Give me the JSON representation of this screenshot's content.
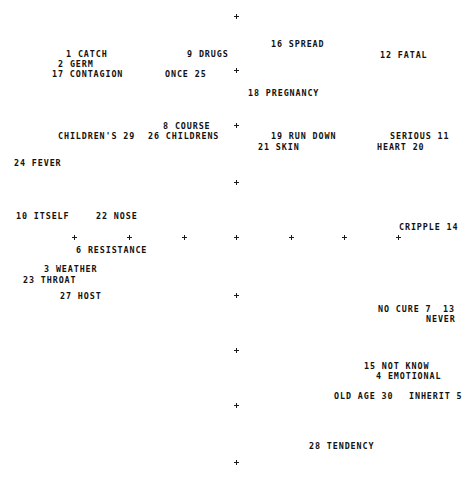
{
  "chart_data": {
    "type": "scatter",
    "title": "",
    "subtitle": "",
    "xlabel": "",
    "ylabel": "",
    "grid": false,
    "legend": null,
    "axis_style": "cross-tick markers only, no drawn axis lines",
    "xlim": [
      0,
      471
    ],
    "ylim": [
      0,
      477
    ],
    "note": "Point labels are rendered directly at the data coordinates; each label combines a rank number and a concept word.",
    "x_axis_ticks": [
      {
        "x": 75,
        "y": 237
      },
      {
        "x": 130,
        "y": 237
      },
      {
        "x": 185,
        "y": 237
      },
      {
        "x": 237,
        "y": 237
      },
      {
        "x": 292,
        "y": 237
      },
      {
        "x": 345,
        "y": 237
      },
      {
        "x": 399,
        "y": 237
      }
    ],
    "y_axis_ticks": [
      {
        "x": 237,
        "y": 16
      },
      {
        "x": 237,
        "y": 70
      },
      {
        "x": 237,
        "y": 125
      },
      {
        "x": 237,
        "y": 182
      },
      {
        "x": 237,
        "y": 237
      },
      {
        "x": 237,
        "y": 295
      },
      {
        "x": 237,
        "y": 350
      },
      {
        "x": 237,
        "y": 405
      },
      {
        "x": 237,
        "y": 462
      }
    ],
    "points": [
      {
        "id": 1,
        "label": "1 CATCH",
        "number": 1,
        "word": "CATCH",
        "x": 66,
        "y": 49
      },
      {
        "id": 2,
        "label": "9 DRUGS",
        "number": 9,
        "word": "DRUGS",
        "x": 187,
        "y": 49
      },
      {
        "id": 3,
        "label": "16 SPREAD",
        "number": 16,
        "word": "SPREAD",
        "x": 271,
        "y": 39
      },
      {
        "id": 4,
        "label": "12 FATAL",
        "number": 12,
        "word": "FATAL",
        "x": 380,
        "y": 50
      },
      {
        "id": 5,
        "label": "2 GERM",
        "number": 2,
        "word": "GERM",
        "x": 58,
        "y": 59
      },
      {
        "id": 6,
        "label": "17 CONTAGION",
        "number": 17,
        "word": "CONTAGION",
        "x": 52,
        "y": 69
      },
      {
        "id": 7,
        "label": "ONCE 25",
        "number": 25,
        "word": "ONCE",
        "x": 165,
        "y": 69
      },
      {
        "id": 8,
        "label": "18 PREGNANCY",
        "number": 18,
        "word": "PREGNANCY",
        "x": 248,
        "y": 88
      },
      {
        "id": 9,
        "label": "8 COURSE",
        "number": 8,
        "word": "COURSE",
        "x": 163,
        "y": 121
      },
      {
        "id": 10,
        "label": "CHILDREN'S 29",
        "number": 29,
        "word": "CHILDREN'S",
        "x": 58,
        "y": 131
      },
      {
        "id": 11,
        "label": "26 CHILDRENS",
        "number": 26,
        "word": "CHILDRENS",
        "x": 148,
        "y": 131
      },
      {
        "id": 12,
        "label": "19 RUN DOWN",
        "number": 19,
        "word": "RUN DOWN",
        "x": 271,
        "y": 131
      },
      {
        "id": 13,
        "label": "SERIOUS 11",
        "number": 11,
        "word": "SERIOUS",
        "x": 390,
        "y": 131
      },
      {
        "id": 14,
        "label": "21 SKIN",
        "number": 21,
        "word": "SKIN",
        "x": 258,
        "y": 142
      },
      {
        "id": 15,
        "label": "HEART 20",
        "number": 20,
        "word": "HEART",
        "x": 377,
        "y": 142
      },
      {
        "id": 16,
        "label": "24 FEVER",
        "number": 24,
        "word": "FEVER",
        "x": 14,
        "y": 158
      },
      {
        "id": 17,
        "label": "10 ITSELF",
        "number": 10,
        "word": "ITSELF",
        "x": 16,
        "y": 211
      },
      {
        "id": 18,
        "label": "22 NOSE",
        "number": 22,
        "word": "NOSE",
        "x": 96,
        "y": 211
      },
      {
        "id": 19,
        "label": "CRIPPLE 14",
        "number": 14,
        "word": "CRIPPLE",
        "x": 399,
        "y": 222
      },
      {
        "id": 20,
        "label": "6 RESISTANCE",
        "number": 6,
        "word": "RESISTANCE",
        "x": 76,
        "y": 245
      },
      {
        "id": 21,
        "label": "3 WEATHER",
        "number": 3,
        "word": "WEATHER",
        "x": 44,
        "y": 264
      },
      {
        "id": 22,
        "label": "23 THROAT",
        "number": 23,
        "word": "THROAT",
        "x": 23,
        "y": 275
      },
      {
        "id": 23,
        "label": "27 HOST",
        "number": 27,
        "word": "HOST",
        "x": 60,
        "y": 291
      },
      {
        "id": 24,
        "label": "NO CURE 7",
        "number": 7,
        "word": "NO CURE",
        "x": 378,
        "y": 304
      },
      {
        "id": 25,
        "label": "13",
        "number": 13,
        "word": "",
        "x": 443,
        "y": 304
      },
      {
        "id": 26,
        "label": "NEVER",
        "number": 13,
        "word": "NEVER",
        "x": 426,
        "y": 314
      },
      {
        "id": 27,
        "label": "15 NOT KNOW",
        "number": 15,
        "word": "NOT KNOW",
        "x": 364,
        "y": 361
      },
      {
        "id": 28,
        "label": "4 EMOTIONAL",
        "number": 4,
        "word": "EMOTIONAL",
        "x": 376,
        "y": 371
      },
      {
        "id": 29,
        "label": "OLD AGE 30",
        "number": 30,
        "word": "OLD AGE",
        "x": 334,
        "y": 391
      },
      {
        "id": 30,
        "label": "INHERIT 5",
        "number": 5,
        "word": "INHERIT",
        "x": 409,
        "y": 391
      },
      {
        "id": 31,
        "label": "28 TENDENCY",
        "number": 28,
        "word": "TENDENCY",
        "x": 309,
        "y": 441
      }
    ]
  },
  "colors": {
    "background": "#ffffff",
    "text": "#121212",
    "tick": "#1a1a1a"
  }
}
